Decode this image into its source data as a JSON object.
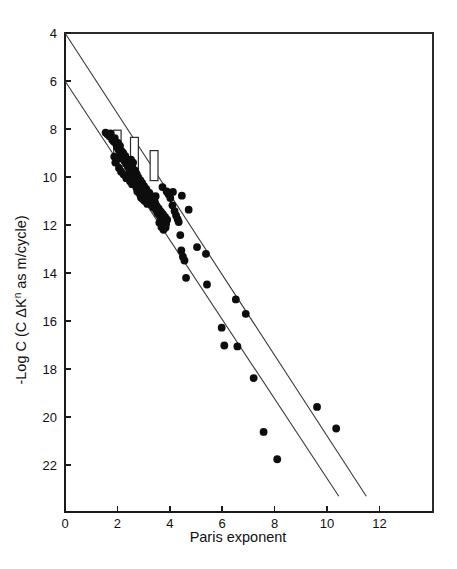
{
  "figure": {
    "background": "#ffffff",
    "ink_color": "#111111",
    "point_color": "#0d0d0d",
    "line_color": "#3a3a3a"
  },
  "chart_data": {
    "type": "scatter",
    "title": "",
    "subtitle": "",
    "xlabel": "Paris exponent",
    "ylabel": "-Log C   (C ΔKⁿ as m/cycle)",
    "ylabel_parts": {
      "prefix": "-Log C   (C ΔK",
      "superscript": "n",
      "suffix": " as m/cycle)"
    },
    "xlim": [
      0,
      14.1
    ],
    "ylim": [
      4,
      23.3
    ],
    "y_axis_inverted": true,
    "grid": false,
    "legend": null,
    "xticks": [
      0,
      2,
      4,
      6,
      8,
      10,
      12
    ],
    "xticklabels": [
      "0",
      "2",
      "4",
      "6",
      "8",
      "10",
      "12"
    ],
    "yticks": [
      4,
      6,
      8,
      10,
      12,
      14,
      16,
      18,
      20,
      22
    ],
    "yticklabels": [
      "4",
      "6",
      "8",
      "10",
      "12",
      "14",
      "16",
      "18",
      "20",
      "22"
    ],
    "series": [
      {
        "name": "Paris law data",
        "marker": "filled-circle",
        "marker_size": 4.6,
        "points": [
          [
            1.55,
            8.15
          ],
          [
            1.62,
            8.22
          ],
          [
            1.7,
            8.3
          ],
          [
            1.74,
            8.18
          ],
          [
            1.8,
            8.45
          ],
          [
            1.86,
            8.52
          ],
          [
            1.9,
            8.38
          ],
          [
            1.95,
            8.62
          ],
          [
            1.98,
            8.75
          ],
          [
            2.02,
            8.58
          ],
          [
            2.05,
            8.88
          ],
          [
            2.1,
            8.7
          ],
          [
            2.12,
            9.05
          ],
          [
            2.16,
            8.92
          ],
          [
            2.2,
            9.18
          ],
          [
            2.22,
            9.0
          ],
          [
            2.26,
            9.32
          ],
          [
            2.3,
            9.12
          ],
          [
            2.33,
            9.45
          ],
          [
            2.36,
            9.26
          ],
          [
            2.4,
            9.58
          ],
          [
            2.42,
            9.38
          ],
          [
            2.46,
            9.7
          ],
          [
            2.5,
            9.5
          ],
          [
            2.52,
            9.28
          ],
          [
            2.55,
            9.85
          ],
          [
            2.58,
            9.62
          ],
          [
            2.6,
            9.4
          ],
          [
            2.64,
            9.96
          ],
          [
            2.68,
            9.74
          ],
          [
            2.7,
            10.1
          ],
          [
            2.74,
            9.88
          ],
          [
            2.78,
            10.22
          ],
          [
            2.8,
            10.02
          ],
          [
            2.84,
            10.35
          ],
          [
            2.88,
            10.14
          ],
          [
            2.92,
            10.48
          ],
          [
            2.95,
            10.26
          ],
          [
            3.0,
            10.58
          ],
          [
            3.02,
            10.38
          ],
          [
            3.06,
            10.7
          ],
          [
            3.1,
            10.5
          ],
          [
            3.12,
            10.84
          ],
          [
            3.16,
            10.62
          ],
          [
            3.2,
            10.95
          ],
          [
            3.24,
            10.74
          ],
          [
            3.26,
            11.06
          ],
          [
            3.3,
            10.86
          ],
          [
            3.34,
            11.18
          ],
          [
            3.38,
            10.98
          ],
          [
            3.4,
            11.28
          ],
          [
            3.44,
            11.1
          ],
          [
            3.48,
            11.4
          ],
          [
            3.5,
            11.2
          ],
          [
            3.54,
            11.52
          ],
          [
            3.58,
            11.32
          ],
          [
            3.62,
            11.62
          ],
          [
            3.66,
            11.44
          ],
          [
            3.7,
            11.74
          ],
          [
            3.74,
            11.55
          ],
          [
            3.78,
            11.86
          ],
          [
            3.82,
            11.66
          ],
          [
            3.86,
            11.95
          ],
          [
            3.9,
            11.78
          ],
          [
            2.9,
            10.85
          ],
          [
            2.96,
            10.92
          ],
          [
            3.04,
            11.0
          ],
          [
            3.08,
            10.78
          ],
          [
            3.14,
            11.12
          ],
          [
            3.18,
            11.02
          ],
          [
            3.22,
            10.66
          ],
          [
            3.28,
            10.92
          ],
          [
            3.36,
            11.24
          ],
          [
            3.42,
            11.02
          ],
          [
            3.46,
            10.8
          ],
          [
            3.52,
            11.36
          ],
          [
            2.44,
            9.98
          ],
          [
            2.48,
            10.18
          ],
          [
            2.56,
            10.3
          ],
          [
            2.62,
            10.08
          ],
          [
            2.72,
            10.44
          ],
          [
            2.76,
            10.6
          ],
          [
            2.86,
            10.72
          ],
          [
            2.98,
            10.55
          ],
          [
            3.95,
            10.72
          ],
          [
            4.02,
            10.88
          ],
          [
            4.1,
            11.18
          ],
          [
            4.18,
            11.42
          ],
          [
            4.24,
            11.6
          ],
          [
            4.3,
            11.76
          ],
          [
            4.34,
            11.88
          ],
          [
            4.4,
            12.42
          ],
          [
            4.44,
            13.06
          ],
          [
            4.5,
            13.32
          ],
          [
            4.56,
            13.48
          ],
          [
            4.62,
            14.2
          ],
          [
            4.12,
            10.62
          ],
          [
            4.46,
            10.78
          ],
          [
            4.72,
            11.36
          ],
          [
            5.04,
            12.92
          ],
          [
            5.38,
            13.2
          ],
          [
            5.42,
            14.48
          ],
          [
            5.98,
            16.28
          ],
          [
            6.08,
            17.02
          ],
          [
            6.52,
            15.1
          ],
          [
            6.58,
            17.06
          ],
          [
            6.9,
            15.7
          ],
          [
            7.2,
            18.38
          ],
          [
            7.58,
            20.62
          ],
          [
            8.1,
            21.76
          ],
          [
            9.62,
            19.58
          ],
          [
            10.35,
            20.48
          ],
          [
            2.06,
            9.62
          ],
          [
            2.14,
            9.78
          ],
          [
            2.24,
            9.9
          ],
          [
            2.34,
            10.05
          ],
          [
            1.88,
            9.15
          ],
          [
            1.92,
            9.4
          ],
          [
            2.0,
            9.25
          ],
          [
            3.6,
            11.9
          ],
          [
            3.68,
            12.08
          ],
          [
            3.76,
            12.2
          ],
          [
            3.84,
            12.1
          ],
          [
            3.72,
            10.42
          ],
          [
            3.88,
            10.6
          ]
        ]
      }
    ],
    "trend_lines": [
      {
        "name": "upper-bound-line",
        "from": [
          0,
          4
        ],
        "to": [
          11.5,
          23.3
        ],
        "style": "solid"
      },
      {
        "name": "lower-bound-line",
        "from": [
          0,
          6
        ],
        "to": [
          10.45,
          23.3
        ],
        "style": "solid"
      }
    ],
    "box_markers": [
      {
        "name": "box-marker-1",
        "x_center": 2.0,
        "y_top": 8.05,
        "y_bottom": 9.35,
        "width_units": 0.28
      },
      {
        "name": "box-marker-2",
        "x_center": 2.65,
        "y_top": 8.35,
        "y_bottom": 9.8,
        "width_units": 0.3
      },
      {
        "name": "box-marker-3",
        "x_center": 3.4,
        "y_top": 8.9,
        "y_bottom": 10.15,
        "width_units": 0.3
      }
    ]
  }
}
